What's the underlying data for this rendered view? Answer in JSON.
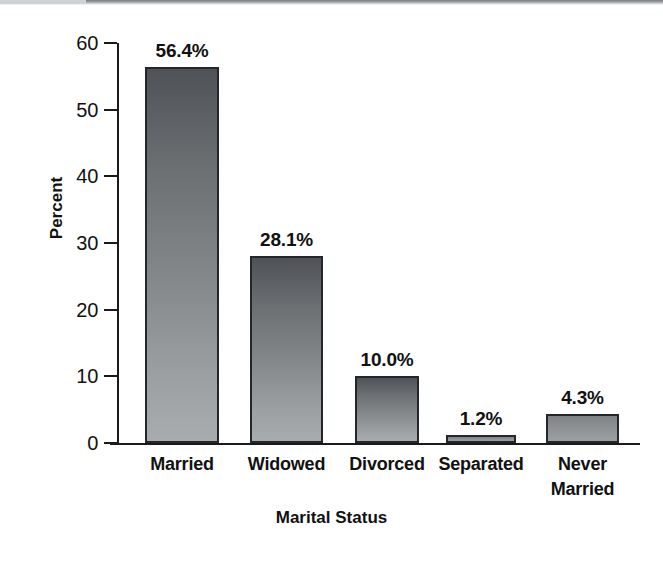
{
  "chart_data": {
    "type": "bar",
    "title": "",
    "xlabel": "Marital Status",
    "ylabel": "Percent",
    "categories": [
      "Married",
      "Widowed",
      "Divorced",
      "Separated",
      "Never Married"
    ],
    "category_lines": [
      [
        "Married"
      ],
      [
        "Widowed"
      ],
      [
        "Divorced"
      ],
      [
        "Separated"
      ],
      [
        "Never",
        "Married"
      ]
    ],
    "values": [
      56.4,
      28.1,
      10.0,
      1.2,
      4.3
    ],
    "value_labels": [
      "56.4%",
      "28.1%",
      "10.0%",
      "1.2%",
      "4.3%"
    ],
    "ylim": [
      0,
      60
    ],
    "y_ticks": [
      0,
      10,
      20,
      30,
      40,
      50,
      60
    ],
    "y_tick_labels": [
      "0",
      "10",
      "20",
      "30",
      "40",
      "50",
      "60"
    ],
    "grid": false,
    "legend": false,
    "bar_color_top": "#4f5357",
    "bar_color_bottom": "#a8acae",
    "bar_border_color": "#23262a",
    "axis_color": "#1a1a1a",
    "background": "#ffffff"
  }
}
